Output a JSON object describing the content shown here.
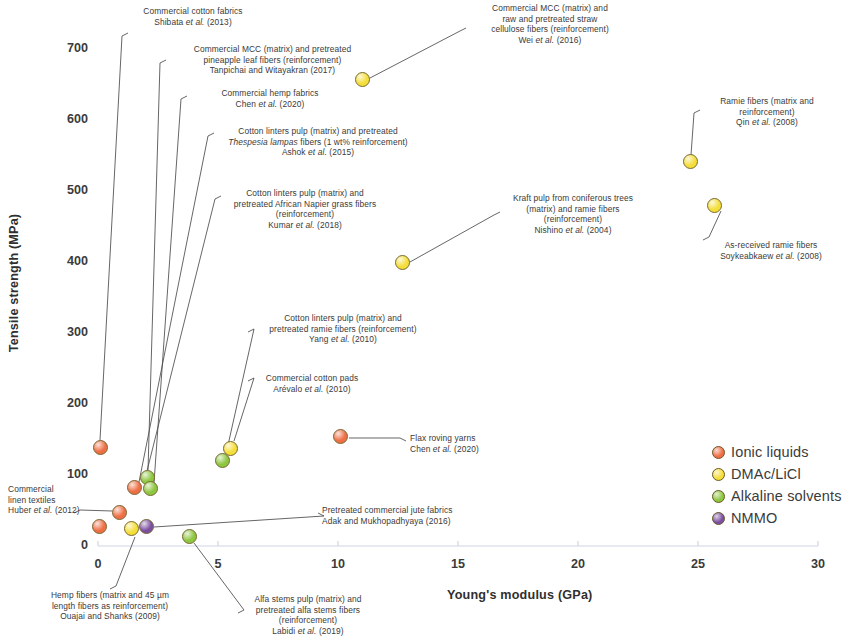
{
  "chart_data": {
    "type": "scatter",
    "title": "",
    "xlabel": "Young's modulus (GPa)",
    "ylabel": "Tensile strength (MPa)",
    "xlim": [
      0,
      30
    ],
    "ylim": [
      0,
      750
    ],
    "xticks": [
      "0",
      "5",
      "10",
      "15",
      "20",
      "25",
      "30"
    ],
    "yticks": [
      "0",
      "100",
      "200",
      "300",
      "400",
      "500",
      "600",
      "700"
    ],
    "grid": false,
    "legend_position": "bottom-right",
    "legend": [
      {
        "label": "Ionic liquids",
        "color": "#ee6f45"
      },
      {
        "label": "DMAc/LiCl",
        "color": "#f4de3a"
      },
      {
        "label": "Alkaline solvents",
        "color": "#8dc63f"
      },
      {
        "label": "NMMO",
        "color": "#7b4fa0"
      }
    ],
    "points": [
      {
        "name": "shibata-2013",
        "x": 0.1,
        "y": 139,
        "series": "Ionic liquids"
      },
      {
        "name": "huber-2012",
        "x": 0.9,
        "y": 47,
        "series": "Ionic liquids"
      },
      {
        "name": "ouajai-shanks-2009",
        "x": 0.05,
        "y": 27,
        "series": "Ionic liquids"
      },
      {
        "name": "ashok-2015",
        "x": 1.5,
        "y": 82,
        "series": "Ionic liquids"
      },
      {
        "name": "tanpichai-2017",
        "x": 2.05,
        "y": 97,
        "series": "Alkaline solvents"
      },
      {
        "name": "chen-2020-hemp",
        "x": 2.2,
        "y": 81,
        "series": "Alkaline solvents"
      },
      {
        "name": "dmac-origin",
        "x": 1.4,
        "y": 24,
        "series": "DMAc/LiCl"
      },
      {
        "name": "nmmo-origin",
        "x": 2.0,
        "y": 27,
        "series": "NMMO"
      },
      {
        "name": "labidi-2019",
        "x": 3.8,
        "y": 13,
        "series": "Alkaline solvents"
      },
      {
        "name": "arevalo-2010",
        "x": 5.5,
        "y": 138,
        "series": "DMAc/LiCl"
      },
      {
        "name": "yang-2010",
        "x": 5.2,
        "y": 120,
        "series": "Alkaline solvents"
      },
      {
        "name": "chen-2020-flax",
        "x": 10.1,
        "y": 154,
        "series": "Ionic liquids"
      },
      {
        "name": "wei-2016",
        "x": 11.0,
        "y": 657,
        "series": "DMAc/LiCl"
      },
      {
        "name": "nishino-2004",
        "x": 12.7,
        "y": 400,
        "series": "DMAc/LiCl"
      },
      {
        "name": "qin-2008",
        "x": 24.7,
        "y": 541,
        "series": "DMAc/LiCl"
      },
      {
        "name": "soykeabkaew-2008",
        "x": 25.7,
        "y": 480,
        "series": "DMAc/LiCl"
      }
    ],
    "annotations": [
      {
        "name": "shibata-2013",
        "lines": [
          "Commercial cotton fabrics",
          "Shibata et al. (2013)"
        ],
        "italic_line": 1
      },
      {
        "name": "tanpichai-2017",
        "lines": [
          "Commercial MCC (matrix) and pretreated",
          "pineapple leaf fibers (reinforcement)",
          "Tanpichai and Witayakran (2017)"
        ]
      },
      {
        "name": "chen-2020-hemp",
        "lines": [
          "Commercial hemp fabrics",
          "Chen et al. (2020)"
        ],
        "italic_line": 1
      },
      {
        "name": "ashok-2015",
        "lines": [
          "Cotton linters pulp (matrix) and pretreated",
          "Thespesia lampas fibers (1 wt% reinforcement)",
          "Ashok et al. (2015)"
        ]
      },
      {
        "name": "kumar-2018",
        "lines": [
          "Cotton linters pulp (matrix) and",
          "pretreated African Napier grass fibers",
          "(reinforcement)",
          "Kumar et al. (2018)"
        ]
      },
      {
        "name": "wei-2016",
        "lines": [
          "Commercial MCC (matrix) and",
          "raw and pretreated straw",
          "cellulose fibers (reinforcement)",
          "Wei et al. (2016)"
        ]
      },
      {
        "name": "qin-2008",
        "lines": [
          "Ramie fibers (matrix and",
          "reinforcement)",
          "Qin et al. (2008)"
        ]
      },
      {
        "name": "nishino-2004",
        "lines": [
          "Kraft pulp from coniferous trees",
          "(matrix) and ramie fibers",
          "(reinforcement)",
          "Nishino et al. (2004)"
        ]
      },
      {
        "name": "soykeabkaew-2008",
        "lines": [
          "As-received ramie fibers",
          "Soykeabkaew et al. (2008)"
        ]
      },
      {
        "name": "yang-2010",
        "lines": [
          "Cotton linters pulp (matrix) and",
          "pretreated ramie fibers (reinforcement)",
          "Yang et al. (2010)"
        ]
      },
      {
        "name": "arevalo-2010",
        "lines": [
          "Commercial cotton pads",
          "Arévalo et al. (2010)"
        ]
      },
      {
        "name": "chen-2020-flax",
        "lines": [
          "Flax roving yarns",
          "Chen et al. (2020)"
        ]
      },
      {
        "name": "huber-2012",
        "lines": [
          "Commercial",
          "linen textiles",
          "Huber et al. (2012)"
        ]
      },
      {
        "name": "adak-2016",
        "lines": [
          "Pretreated commercial jute fabrics",
          "Adak and Mukhopadhyaya (2016)"
        ]
      },
      {
        "name": "ouajai-shanks-2009",
        "lines": [
          "Hemp fibers (matrix and 45 µm",
          "length fibers as reinforcement)",
          "Ouajai and Shanks (2009)"
        ]
      },
      {
        "name": "labidi-2019",
        "lines": [
          "Alfa stems pulp (matrix) and",
          "pretreated alfa stems fibers",
          "(reinforcement)",
          "Labidi et al. (2019)"
        ]
      }
    ]
  }
}
